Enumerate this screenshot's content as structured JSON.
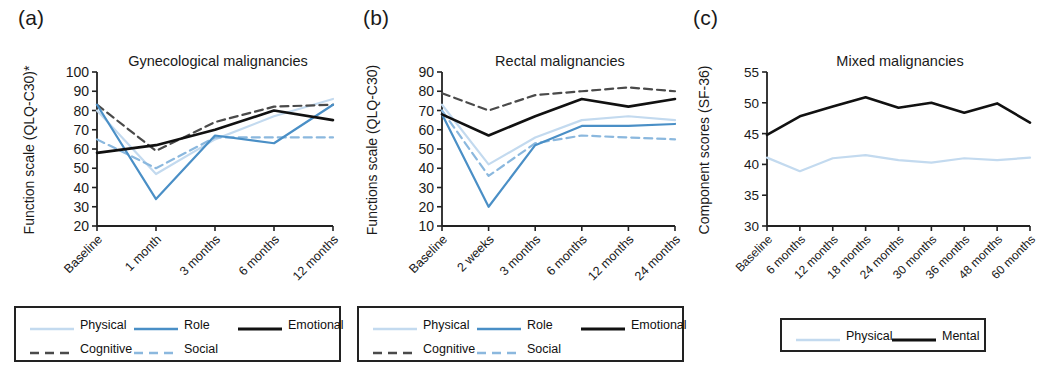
{
  "figure": {
    "panels": [
      {
        "letter": "(a)",
        "title": "Gynecological malignancies",
        "ylabel": "Function scale (QLQ-C30)*"
      },
      {
        "letter": "(b)",
        "title": "Rectal malignancies",
        "ylabel": "Functions scale (QLQ-C30)"
      },
      {
        "letter": "(c)",
        "title": "Mixed malignancies",
        "ylabel": "Component scores (SF-36)"
      }
    ]
  },
  "colors": {
    "physical": "#c3daef",
    "role": "#4a8fc6",
    "emotional": "#111111",
    "cognitive": "#4a4a4a",
    "social": "#8bb8de",
    "mental": "#111111",
    "axis": "#222222",
    "legend_border": "#222222"
  },
  "legends": {
    "ab": {
      "items": [
        {
          "label": "Physical",
          "style": "solid",
          "color_key": "physical"
        },
        {
          "label": "Role",
          "style": "solid",
          "color_key": "role"
        },
        {
          "label": "Emotional",
          "style": "solid",
          "color_key": "emotional"
        },
        {
          "label": "Cognitive",
          "style": "dashed",
          "color_key": "cognitive"
        },
        {
          "label": "Social",
          "style": "dashed",
          "color_key": "social"
        }
      ]
    },
    "c": {
      "items": [
        {
          "label": "Physical",
          "style": "solid",
          "color_key": "physical"
        },
        {
          "label": "Mental",
          "style": "solid",
          "color_key": "mental"
        }
      ]
    }
  },
  "chart_data": [
    {
      "type": "line",
      "panel": "a",
      "title": "Gynecological malignancies",
      "xlabel": "",
      "ylabel": "Function scale (QLQ-C30)*",
      "categories": [
        "Baseline",
        "1 month",
        "3 months",
        "6 months",
        "12 months"
      ],
      "yticks": [
        20,
        30,
        40,
        50,
        60,
        70,
        80,
        90,
        100
      ],
      "ylim": [
        20,
        100
      ],
      "grid": false,
      "legend_position": "below-figure",
      "series": [
        {
          "name": "Physical",
          "style": "solid",
          "values": [
            80,
            47,
            65,
            77,
            86
          ]
        },
        {
          "name": "Role",
          "style": "solid",
          "values": [
            83,
            34,
            67,
            63,
            83
          ]
        },
        {
          "name": "Emotional",
          "style": "solid",
          "values": [
            58,
            62,
            70,
            80,
            75
          ]
        },
        {
          "name": "Cognitive",
          "style": "dashed",
          "values": [
            83,
            59,
            74,
            82,
            83
          ]
        },
        {
          "name": "Social",
          "style": "dashed",
          "values": [
            65,
            50,
            66,
            66,
            66
          ]
        }
      ]
    },
    {
      "type": "line",
      "panel": "b",
      "title": "Rectal malignancies",
      "xlabel": "",
      "ylabel": "Functions scale (QLQ-C30)",
      "categories": [
        "Baseline",
        "2 weeks",
        "3 months",
        "6 months",
        "12 months",
        "24 months"
      ],
      "yticks": [
        10,
        20,
        30,
        40,
        50,
        60,
        70,
        80,
        90
      ],
      "ylim": [
        10,
        90
      ],
      "grid": false,
      "legend_position": "below-figure",
      "series": [
        {
          "name": "Physical",
          "style": "solid",
          "values": [
            73,
            42,
            56,
            65,
            67,
            65
          ]
        },
        {
          "name": "Role",
          "style": "solid",
          "values": [
            68,
            20,
            52,
            62,
            62,
            63
          ]
        },
        {
          "name": "Emotional",
          "style": "solid",
          "values": [
            68,
            57,
            67,
            76,
            72,
            76
          ]
        },
        {
          "name": "Cognitive",
          "style": "dashed",
          "values": [
            79,
            70,
            78,
            80,
            82,
            80
          ]
        },
        {
          "name": "Social",
          "style": "dashed",
          "values": [
            70,
            36,
            53,
            57,
            56,
            55
          ]
        }
      ]
    },
    {
      "type": "line",
      "panel": "c",
      "title": "Mixed malignancies",
      "xlabel": "",
      "ylabel": "Component scores (SF-36)",
      "categories": [
        "Baseline",
        "6 months",
        "12 months",
        "18 months",
        "24 months",
        "30 months",
        "36 months",
        "48 months",
        "60 months"
      ],
      "yticks": [
        30,
        35,
        40,
        45,
        50,
        55
      ],
      "ylim": [
        30,
        55
      ],
      "grid": false,
      "legend_position": "below-panel",
      "series": [
        {
          "name": "Physical",
          "style": "solid",
          "values": [
            41.1,
            38.9,
            41.0,
            41.5,
            40.7,
            40.3,
            41.0,
            40.7,
            41.1
          ]
        },
        {
          "name": "Mental",
          "style": "solid",
          "values": [
            44.8,
            47.8,
            49.4,
            50.9,
            49.2,
            50.0,
            48.4,
            49.9,
            46.8
          ]
        }
      ]
    }
  ]
}
